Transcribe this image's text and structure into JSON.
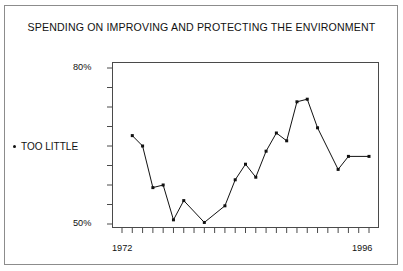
{
  "figure": {
    "title": "SPENDING ON IMPROVING AND PROTECTING THE ENVIRONMENT",
    "background_color": "#ffffff",
    "frame_color": "#8c8c8c",
    "axis_color": "#4a4a4a",
    "line_color": "#111111"
  },
  "axes": {
    "y_top_label": "80%",
    "y_bottom_label": "50%",
    "x_start_label": "1972",
    "x_end_label": "1996"
  },
  "legend": {
    "series_label": "TOO LITTLE",
    "marker": "dot-marker"
  },
  "chart_data": {
    "type": "line",
    "title": "SPENDING ON IMPROVING AND PROTECTING THE ENVIRONMENT",
    "xlabel": "",
    "ylabel": "",
    "series_name": "TOO LITTLE",
    "grid": false,
    "legend_position": "left-outside",
    "xlim": [
      1972,
      1996
    ],
    "ylim": [
      48,
      82
    ],
    "ytick_labels": [
      "80%",
      "50%"
    ],
    "ytick_values": [
      80,
      50
    ],
    "xtick_labels": [
      "1972",
      "1996"
    ],
    "xtick_values": [
      1972,
      1996
    ],
    "x": [
      1973,
      1974,
      1975,
      1976,
      1977,
      1978,
      1980,
      1982,
      1983,
      1984,
      1985,
      1986,
      1987,
      1988,
      1989,
      1990,
      1991,
      1993,
      1994,
      1996
    ],
    "values": [
      67,
      65,
      57,
      57.5,
      50.8,
      54.5,
      50.3,
      53.5,
      58.5,
      61.5,
      59,
      64,
      67.5,
      66,
      73.5,
      74,
      68.5,
      60.5,
      63,
      63
    ],
    "marker": "square",
    "line_width": 1
  }
}
